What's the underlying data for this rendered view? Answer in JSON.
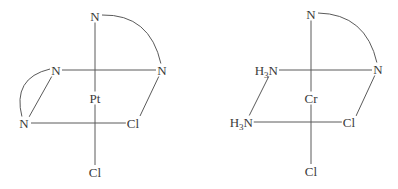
{
  "diagram": {
    "type": "octahedral coordination complexes",
    "line_color": "#5a5a5a",
    "text_color": "#3a3a3a",
    "left_complex": {
      "metal": "Pt",
      "ligands": {
        "top": "N",
        "equatorial_back_left": "N",
        "equatorial_back_right": "N",
        "equatorial_front_left": "N",
        "equatorial_front_right": "Cl",
        "bottom": "Cl"
      },
      "chelate_arcs": [
        "top N – back-right N",
        "back-left N – front-left N"
      ]
    },
    "right_complex": {
      "metal": "Cr",
      "ligands": {
        "top": "N",
        "equatorial_back_left": {
          "prefix": "H",
          "sub": "3",
          "atom": "N"
        },
        "equatorial_back_right": "N",
        "equatorial_front_left": {
          "prefix": "H",
          "sub": "3",
          "atom": "N"
        },
        "equatorial_front_right": "Cl",
        "bottom": "Cl"
      },
      "chelate_arcs": [
        "top N – back-right N"
      ]
    }
  }
}
